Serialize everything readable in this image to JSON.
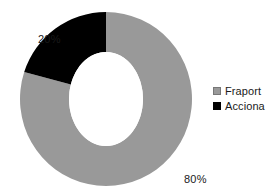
{
  "chart_data": {
    "type": "pie",
    "variant": "donut",
    "title": "",
    "subtitle": "",
    "xlabel": "",
    "ylabel": "",
    "grid": false,
    "legend_position": "right",
    "units": "percent",
    "categories": [
      "Fraport",
      "Acciona"
    ],
    "values": [
      80,
      20
    ],
    "slices": [
      {
        "label": "Fraport",
        "value": 80,
        "data_label": "80%",
        "color": "#999999",
        "start_angle_deg": 0,
        "end_angle_deg": 288,
        "direction": "clockwise"
      },
      {
        "label": "Acciona",
        "value": 20,
        "data_label": "20%",
        "color": "#000000",
        "start_angle_deg": 288,
        "end_angle_deg": 360,
        "direction": "clockwise"
      }
    ],
    "annotations": [
      "20%",
      "80%"
    ]
  },
  "labels": {
    "acciona_pct": "20%",
    "fraport_pct": "80%"
  },
  "legend": {
    "items": [
      {
        "label": "Fraport",
        "color": "#999999"
      },
      {
        "label": "Acciona",
        "color": "#000000"
      }
    ]
  },
  "colors": {
    "background": "#ffffff",
    "fraport": "#999999",
    "acciona": "#000000",
    "text": "#1a1a1a",
    "hole": "#ffffff"
  }
}
